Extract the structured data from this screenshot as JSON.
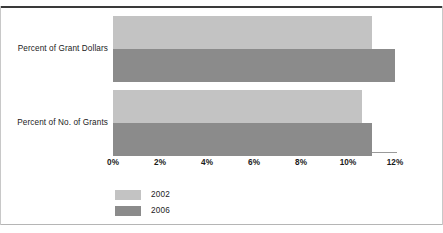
{
  "chart_data": {
    "type": "bar",
    "orientation": "horizontal",
    "title": "",
    "xlabel": "",
    "ylabel": "",
    "categories": [
      "Percent of Grant Dollars",
      "Percent of No. of Grants"
    ],
    "series": [
      {
        "name": "2002",
        "color": "#c3c3c3",
        "values": [
          11.0,
          10.6
        ]
      },
      {
        "name": "2006",
        "color": "#8b8b8b",
        "values": [
          12.0,
          11.0
        ]
      }
    ],
    "xlim": [
      0,
      12
    ],
    "xticks": [
      0,
      2,
      4,
      6,
      8,
      10,
      12
    ],
    "xtick_labels": [
      "0%",
      "2%",
      "4%",
      "6%",
      "8%",
      "10%",
      "12%"
    ],
    "grid": false,
    "legend_position": "bottom-left"
  },
  "legend": {
    "items": [
      {
        "label": "2002"
      },
      {
        "label": "2006"
      }
    ]
  },
  "axis": {
    "tick_labels": [
      "0%",
      "2%",
      "4%",
      "6%",
      "8%",
      "10%",
      "12%"
    ]
  },
  "categories": {
    "items": [
      "Percent of Grant Dollars",
      "Percent of No. of Grants"
    ]
  }
}
